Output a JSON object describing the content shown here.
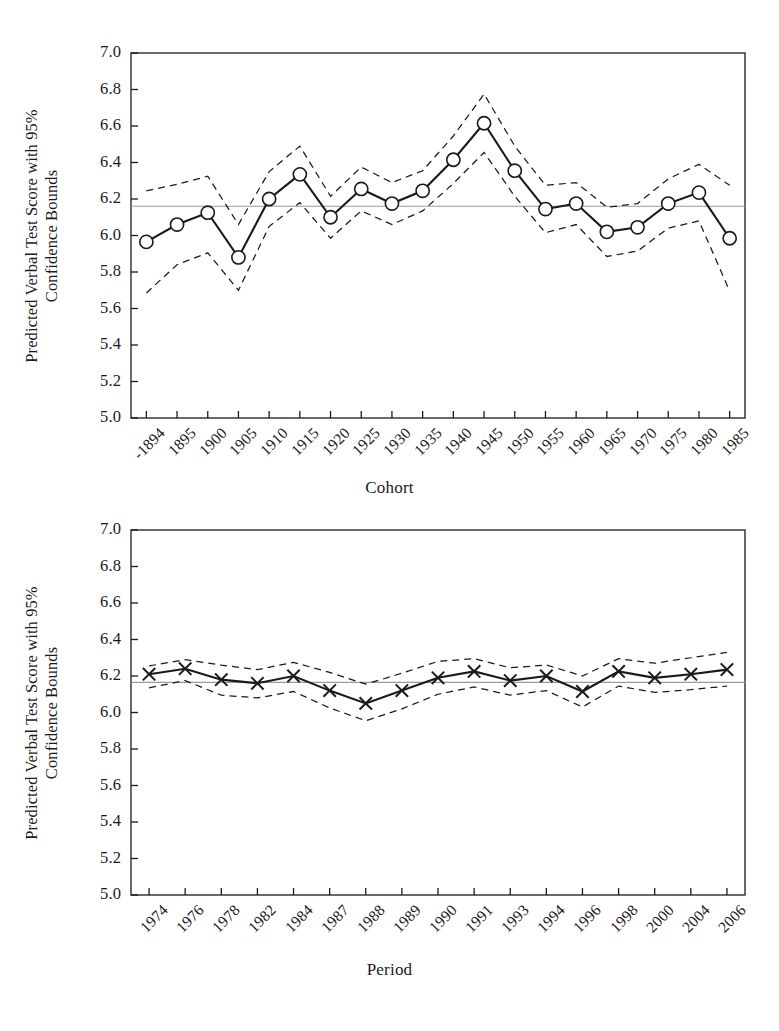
{
  "figure": {
    "background": "#ffffff",
    "ink": "#1a1a1a",
    "reference_line_color": "#9a9a9a"
  },
  "panels": [
    {
      "id": "cohort",
      "ylabel_line1": "Predicted Verbal Test Score with 95%",
      "ylabel_line2": "Confidence Bounds",
      "xlabel": "Cohort"
    },
    {
      "id": "period",
      "ylabel_line1": "Predicted Verbal Test Score with 95%",
      "ylabel_line2": "Confidence Bounds",
      "xlabel": "Period"
    }
  ],
  "chart_data": [
    {
      "type": "line",
      "id": "cohort-plot",
      "title": "",
      "xlabel": "Cohort",
      "ylabel": "Predicted Verbal Test Score with 95% Confidence Bounds",
      "ylim": [
        5.0,
        7.0
      ],
      "yticks": [
        5.0,
        5.2,
        5.4,
        5.6,
        5.8,
        6.0,
        6.2,
        6.4,
        6.6,
        6.8,
        7.0
      ],
      "ytick_labels": [
        "5.0",
        "5.2",
        "5.4",
        "5.6",
        "5.8",
        "6.0",
        "6.2",
        "6.4",
        "6.6",
        "6.8",
        "7.0"
      ],
      "grid": false,
      "legend": "none",
      "marker": "open-circle",
      "categories": [
        "-1894",
        "1895",
        "1900",
        "1905",
        "1910",
        "1915",
        "1920",
        "1925",
        "1930",
        "1935",
        "1940",
        "1945",
        "1950",
        "1955",
        "1960",
        "1965",
        "1970",
        "1975",
        "1980",
        "1985"
      ],
      "series": [
        {
          "name": "Predicted verbal test score",
          "style": "solid",
          "values": [
            5.965,
            6.06,
            6.125,
            5.88,
            6.2,
            6.335,
            6.1,
            6.255,
            6.175,
            6.245,
            6.415,
            6.615,
            6.355,
            6.145,
            6.175,
            6.02,
            6.045,
            6.175,
            6.235,
            5.985
          ]
        },
        {
          "name": "Upper 95% confidence bound",
          "style": "dashed",
          "values": [
            6.245,
            6.28,
            6.325,
            6.06,
            6.35,
            6.49,
            6.215,
            6.375,
            6.29,
            6.355,
            6.545,
            6.775,
            6.49,
            6.275,
            6.29,
            6.155,
            6.175,
            6.31,
            6.39,
            6.275
          ]
        },
        {
          "name": "Lower 95% confidence bound",
          "style": "dashed",
          "values": [
            5.685,
            5.84,
            5.905,
            5.7,
            6.05,
            6.18,
            5.985,
            6.135,
            6.06,
            6.135,
            6.285,
            6.455,
            6.215,
            6.015,
            6.06,
            5.885,
            5.915,
            6.04,
            6.08,
            5.695
          ]
        }
      ],
      "reference_line": 6.16
    },
    {
      "type": "line",
      "id": "period-plot",
      "title": "",
      "xlabel": "Period",
      "ylabel": "Predicted Verbal Test Score with 95% Confidence Bounds",
      "ylim": [
        5.0,
        7.0
      ],
      "yticks": [
        5.0,
        5.2,
        5.4,
        5.6,
        5.8,
        6.0,
        6.2,
        6.4,
        6.6,
        6.8,
        7.0
      ],
      "ytick_labels": [
        "5.0",
        "5.2",
        "5.4",
        "5.6",
        "5.8",
        "6.0",
        "6.2",
        "6.4",
        "6.6",
        "6.8",
        "7.0"
      ],
      "grid": false,
      "legend": "none",
      "marker": "x-cross",
      "categories": [
        "1974",
        "1976",
        "1978",
        "1982",
        "1984",
        "1987",
        "1988",
        "1989",
        "1990",
        "1991",
        "1993",
        "1994",
        "1996",
        "1998",
        "2000",
        "2004",
        "2006"
      ],
      "series": [
        {
          "name": "Predicted verbal test score",
          "style": "solid",
          "values": [
            6.21,
            6.24,
            6.18,
            6.16,
            6.2,
            6.12,
            6.05,
            6.12,
            6.19,
            6.225,
            6.175,
            6.2,
            6.115,
            6.225,
            6.19,
            6.21,
            6.235
          ]
        },
        {
          "name": "Upper 95% confidence bound",
          "style": "dashed",
          "values": [
            6.255,
            6.29,
            6.26,
            6.235,
            6.275,
            6.22,
            6.155,
            6.215,
            6.28,
            6.295,
            6.245,
            6.26,
            6.2,
            6.295,
            6.27,
            6.3,
            6.33
          ]
        },
        {
          "name": "Lower 95% confidence bound",
          "style": "dashed",
          "values": [
            6.135,
            6.175,
            6.095,
            6.08,
            6.115,
            6.025,
            5.955,
            6.02,
            6.1,
            6.14,
            6.095,
            6.12,
            6.03,
            6.145,
            6.11,
            6.125,
            6.145
          ]
        }
      ],
      "reference_line": 6.165
    }
  ]
}
